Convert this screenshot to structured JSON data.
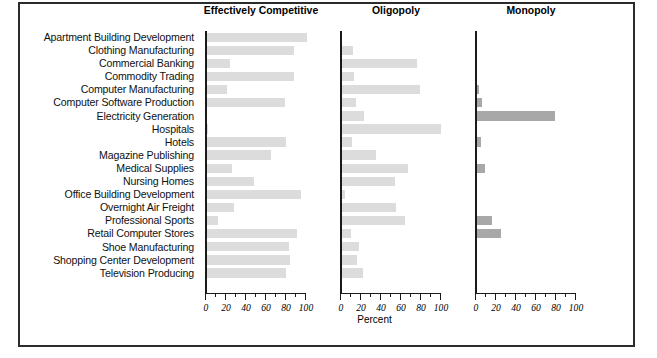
{
  "figure": {
    "axis_label": "Percent",
    "colors": {
      "bar_light": "#dcdcdc",
      "bar_dark": "#a8a8a8",
      "axis": "#1a1a1a",
      "frame": "#2b2b2b",
      "text": "#111111"
    }
  },
  "chart_data": {
    "type": "bar",
    "orientation": "horizontal",
    "title": "",
    "xlabel": "Percent",
    "ylabel": "",
    "xlim": [
      0,
      100
    ],
    "xticks": [
      0,
      20,
      40,
      60,
      80,
      100
    ],
    "minor_tick_step": 10,
    "grid": false,
    "legend": "none",
    "panels": [
      {
        "label": "Effectively Competitive",
        "color": "#dcdcdc"
      },
      {
        "label": "Oligopoly",
        "color": "#dcdcdc"
      },
      {
        "label": "Monopoly",
        "color": "#a8a8a8"
      }
    ],
    "categories": [
      "Apartment Building Development",
      "Clothing Manufacturing",
      "Commercial Banking",
      "Commodity Trading",
      "Computer Manufacturing",
      "Computer Software Production",
      "Electricity Generation",
      "Hospitals",
      "Hotels",
      "Magazine Publishing",
      "Medical Supplies",
      "Nursing Homes",
      "Office Building Development",
      "Overnight Air Freight",
      "Professional Sports",
      "Retail Computer Stores",
      "Shoe Manufacturing",
      "Shopping Center Development",
      "Television Producing"
    ],
    "series": [
      {
        "name": "Effectively Competitive",
        "values": [
          100,
          87,
          23,
          87,
          20,
          78,
          0,
          1,
          79,
          64,
          25,
          47,
          94,
          27,
          11,
          90,
          82,
          83,
          79
        ]
      },
      {
        "name": "Oligopoly",
        "values": [
          0,
          11,
          75,
          12,
          78,
          14,
          22,
          99,
          10,
          34,
          66,
          53,
          3,
          54,
          63,
          9,
          17,
          15,
          21
        ]
      },
      {
        "name": "Monopoly",
        "values": [
          0,
          0,
          0,
          0,
          2,
          5,
          78,
          0,
          4,
          0,
          8,
          0,
          0,
          0,
          15,
          24,
          0,
          0,
          0
        ]
      }
    ]
  }
}
